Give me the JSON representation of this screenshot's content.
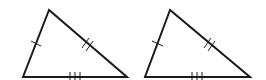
{
  "diagram": {
    "title": "",
    "stroke_color": "#1a1a1a",
    "background": "#ffffff",
    "triangles": [
      {
        "id": "triangle-1",
        "vertices": {
          "apex": [
            49,
            10
          ],
          "bottom_left": [
            23,
            77
          ],
          "bottom_right": [
            127,
            77
          ]
        },
        "tick_marks": {
          "left_side": 1,
          "right_side": 2,
          "base": 3
        }
      },
      {
        "id": "triangle-2",
        "vertices": {
          "apex": [
            170,
            10
          ],
          "bottom_left": [
            145,
            77
          ],
          "bottom_right": [
            250,
            77
          ]
        },
        "tick_marks": {
          "left_side": 1,
          "right_side": 2,
          "base": 3
        }
      }
    ]
  }
}
